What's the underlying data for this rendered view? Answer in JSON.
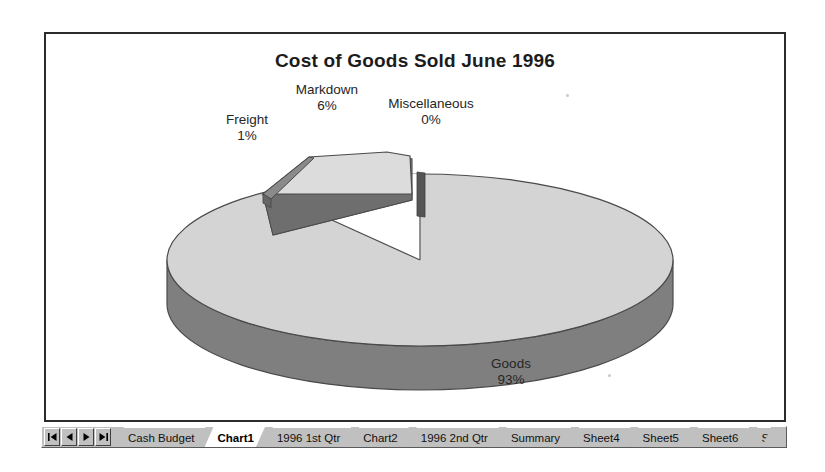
{
  "chart": {
    "title": "Cost of Goods Sold June 1996"
  },
  "chart_data": {
    "type": "pie",
    "title": "Cost of Goods Sold June 1996",
    "categories": [
      "Goods",
      "Markdown",
      "Freight",
      "Miscellaneous"
    ],
    "values": [
      93,
      6,
      1,
      0
    ],
    "value_labels": [
      "93%",
      "6%",
      "1%",
      "0%"
    ],
    "unit": "%",
    "legend": "none",
    "exploded": [
      "Markdown",
      "Freight"
    ],
    "three_d": true,
    "labels": [
      {
        "name": "Freight",
        "value": "1%"
      },
      {
        "name": "Markdown",
        "value": "6%"
      },
      {
        "name": "Miscellaneous",
        "value": "0%"
      },
      {
        "name": "Goods",
        "value": "93%"
      }
    ],
    "colors": {
      "top_surface": "#d4d4d4",
      "side_wall": "#7f7f7f",
      "exploded_top": "#dcdcdc",
      "exploded_side": "#8c8c8c",
      "outline": "#4a4a4a",
      "misc_slice": "#555555"
    }
  },
  "tab_bar": {
    "nav_buttons": [
      {
        "name": "first-sheet",
        "glyph": "|◀"
      },
      {
        "name": "previous-sheet",
        "glyph": "◀"
      },
      {
        "name": "next-sheet",
        "glyph": "▶"
      },
      {
        "name": "last-sheet",
        "glyph": "▶|"
      }
    ],
    "tabs": [
      {
        "label": "Cash Budget",
        "active": false
      },
      {
        "label": "Chart1",
        "active": true
      },
      {
        "label": "1996 1st Qtr",
        "active": false
      },
      {
        "label": "Chart2",
        "active": false
      },
      {
        "label": "1996 2nd Qtr",
        "active": false
      },
      {
        "label": "Summary",
        "active": false
      },
      {
        "label": "Sheet4",
        "active": false
      },
      {
        "label": "Sheet5",
        "active": false
      },
      {
        "label": "Sheet6",
        "active": false
      },
      {
        "label": "S",
        "active": false,
        "clipped": true
      }
    ]
  }
}
